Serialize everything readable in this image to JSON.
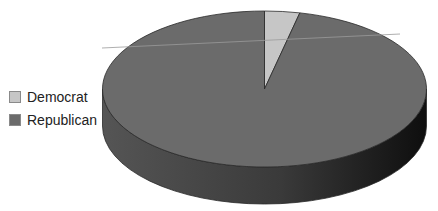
{
  "chart_data": {
    "type": "pie",
    "style": "3d",
    "title": "",
    "categories": [
      "Democrat",
      "Republican"
    ],
    "values": [
      3.5,
      96.5
    ],
    "colors": [
      "#c6c6c6",
      "#6b6b6b"
    ],
    "legend_position": "left"
  },
  "legend": {
    "items": [
      {
        "label": "Democrat",
        "color": "#c6c6c6"
      },
      {
        "label": "Republican",
        "color": "#6b6b6b"
      }
    ]
  },
  "colors": {
    "top_face": "#6b6b6b",
    "side_left": "#4a4a4a",
    "side_right": "#151515",
    "slice_light": "#c6c6c6",
    "outline": "#2a2a2a"
  }
}
